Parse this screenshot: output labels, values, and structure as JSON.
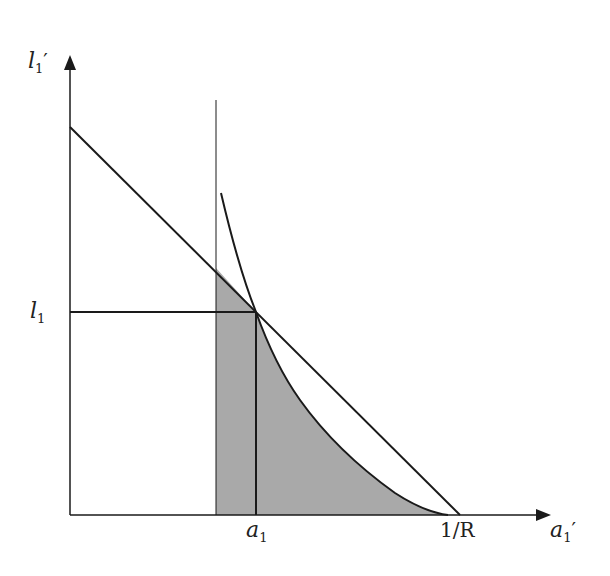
{
  "diagram": {
    "y_axis": {
      "label": "l",
      "subscript": "1",
      "prime": "′"
    },
    "x_axis": {
      "label": "a",
      "subscript": "1",
      "prime": "′"
    },
    "y_tick": {
      "label": "l",
      "subscript": "1"
    },
    "x_ticks": [
      {
        "label": "a",
        "subscript": "1"
      },
      {
        "label": "1/R"
      }
    ],
    "colors": {
      "line": "#1a1a1a",
      "shade": "#a9a9a9",
      "background": "#ffffff"
    }
  }
}
